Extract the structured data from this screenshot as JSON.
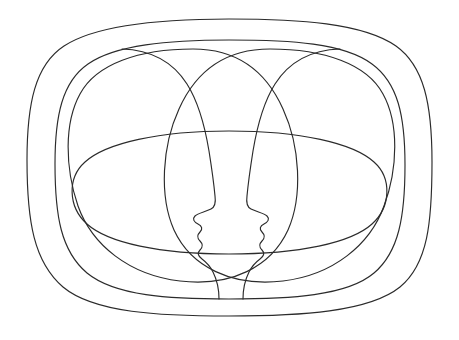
{
  "artwork": {
    "title": "Two Mirrored Face Profiles Within Nested Contours",
    "style": "single-weight continuous line drawing",
    "background_color": "#ffffff",
    "stroke_color": "#2b2b2b",
    "stroke_width": 1.15,
    "canvas": {
      "width": 459,
      "height": 340
    },
    "bounds": {
      "left": 27,
      "top": 19,
      "right": 432,
      "bottom": 316
    },
    "element_count": 6,
    "elements": [
      {
        "name": "outer-rounded-contour",
        "role": "outermost enclosing squircle outline",
        "closed": true,
        "d": "M 229 19 C 160 19 96 25 64 46 C 35 65 27 104 27 160 C 27 222 34 262 63 287 C 94 313 160 316 229 316 C 300 316 369 312 400 287 C 428 264 432 222 432 162 C 432 104 424 66 396 46 C 363 23 299 19 229 19 Z"
      },
      {
        "name": "inner-rounded-contour",
        "role": "second nested squircle outline, inset from the outer one",
        "closed": true,
        "d": "M 229 40 C 168 40 115 45 88 64 C 62 82 55 116 55 164 C 55 216 61 251 87 273 C 115 296 169 299 229 299 C 290 299 347 296 374 273 C 399 252 405 216 405 165 C 405 116 398 83 372 64 C 344 43 291 40 229 40 Z"
      },
      {
        "name": "left-head-circle",
        "role": "large circle forming the left head silhouette",
        "closed": true,
        "d": "M 193 49 C 139 49 96 64 80 94 C 64 123 65 168 78 206 C 92 245 129 275 180 281 C 231 287 271 267 288 230 C 303 196 300 146 283 109 C 266 71 237 49 193 49 Z"
      },
      {
        "name": "right-head-circle",
        "role": "large circle forming the right head silhouette",
        "closed": true,
        "d": "M 270 49 C 226 49 196 71 179 109 C 162 146 159 196 174 230 C 191 267 232 287 283 281 C 333 275 370 245 384 206 C 398 168 399 123 383 94 C 367 64 324 49 270 49 Z"
      },
      {
        "name": "central-horizontal-ellipse",
        "role": "wide flat ellipse crossing the middle of the composition",
        "closed": true,
        "d": "M 229 131 C 159 131 106 143 85 162 C 67 178 68 207 87 224 C 108 243 160 254 229 254 C 299 254 351 243 372 224 C 391 207 392 178 374 162 C 353 143 300 131 229 131 Z"
      },
      {
        "name": "left-face-profile",
        "role": "mirrored facial profile: forehead, brow, nose, lips, chin and neck, facing right",
        "closed": false,
        "features": [
          "forehead",
          "brow",
          "nose-bridge",
          "nose-tip",
          "upper-lip",
          "mouth",
          "lower-lip",
          "chin",
          "jaw",
          "neck"
        ],
        "d": "M 122 49 C 152 50 173 62 187 84 C 199 103 205 127 209 151 C 212 170 214 185 215 196 C 216 203 215 207 211 209 C 205 212 198 213 195 216 C 192 219 194 222 198 224 C 202 226 203 229 200 232 C 197 235 197 238 200 241 C 203 244 203 247 200 250 C 197 253 198 256 202 259 C 206 262 210 266 213 272 C 217 280 219 290 219 299 C 219 299 219 299 219 299"
      },
      {
        "name": "right-face-profile",
        "role": "mirrored facial profile: forehead, brow, nose, lips, chin and neck, facing left",
        "closed": false,
        "features": [
          "forehead",
          "brow",
          "nose-bridge",
          "nose-tip",
          "upper-lip",
          "mouth",
          "lower-lip",
          "chin",
          "jaw",
          "neck"
        ],
        "d": "M 340 49 C 310 50 289 62 275 84 C 263 103 257 127 253 151 C 250 170 248 185 247 196 C 246 203 247 207 251 209 C 257 212 264 213 267 216 C 270 219 268 222 264 224 C 260 226 259 229 262 232 C 265 235 265 238 262 241 C 259 244 259 247 262 250 C 265 253 264 256 260 259 C 256 262 252 266 249 272 C 245 280 243 290 243 299 C 243 299 243 299 243 299"
      }
    ]
  }
}
